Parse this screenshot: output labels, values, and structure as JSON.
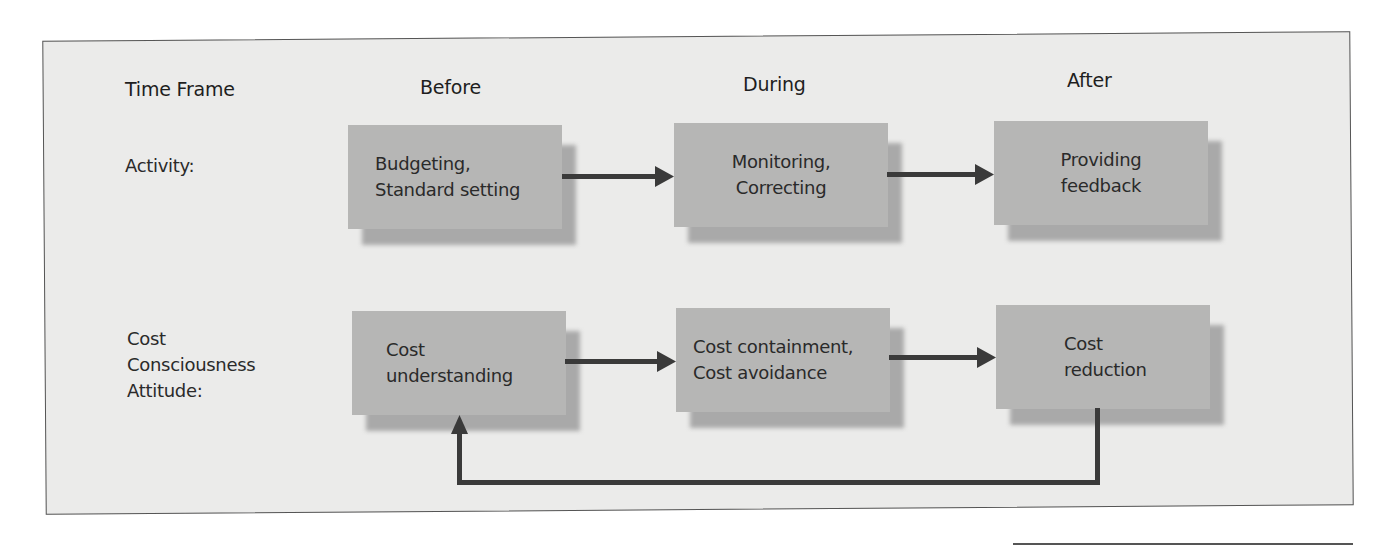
{
  "diagram": {
    "headers": {
      "row_label_header": "Time Frame",
      "columns": [
        "Before",
        "During",
        "After"
      ]
    },
    "rows": [
      {
        "label_lines": [
          "Activity:"
        ],
        "boxes": [
          {
            "lines": [
              "Budgeting,",
              "Standard setting"
            ]
          },
          {
            "lines": [
              "Monitoring,",
              "Correcting"
            ]
          },
          {
            "lines": [
              "Providing",
              "feedback"
            ]
          }
        ]
      },
      {
        "label_lines": [
          "Cost",
          "Consciousness",
          "Attitude:"
        ],
        "boxes": [
          {
            "lines": [
              "Cost",
              "understanding"
            ]
          },
          {
            "lines": [
              "Cost containment,",
              "Cost avoidance"
            ]
          },
          {
            "lines": [
              "Cost",
              "reduction"
            ]
          }
        ]
      }
    ],
    "connections": [
      {
        "from": "Budgeting, Standard setting",
        "to": "Monitoring, Correcting"
      },
      {
        "from": "Monitoring, Correcting",
        "to": "Providing feedback"
      },
      {
        "from": "Cost understanding",
        "to": "Cost containment, Cost avoidance"
      },
      {
        "from": "Cost containment, Cost avoidance",
        "to": "Cost reduction"
      },
      {
        "from": "Cost reduction",
        "to": "Cost understanding",
        "type": "feedback-loop"
      }
    ],
    "colors": {
      "background": "#ebebea",
      "box_fill": "#b6b6b5",
      "box_shadow": "#a9a9a9",
      "arrow": "#3a3a3a",
      "border": "#555555",
      "text": "#2a2a2a"
    }
  }
}
